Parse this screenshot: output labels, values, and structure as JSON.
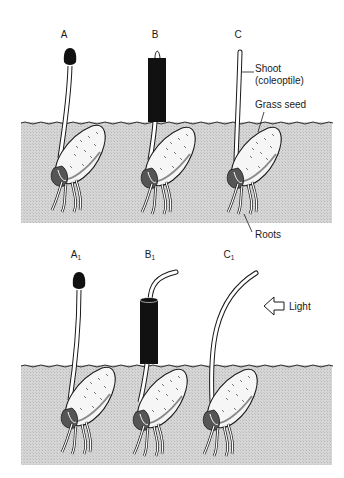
{
  "panels": [
    {
      "id": "top",
      "seedlings": [
        {
          "label": "A",
          "treatment": "tip covered with opaque cap"
        },
        {
          "label": "B",
          "treatment": "base covered with opaque sleeve, tip exposed"
        },
        {
          "label": "C",
          "treatment": "uncovered"
        }
      ],
      "annotations": {
        "shoot": "Shoot",
        "shoot_sub": "(coleoptile)",
        "seed": "Grass seed",
        "roots": "Roots"
      }
    },
    {
      "id": "bottom",
      "seedlings": [
        {
          "label": "A",
          "subscript": "1",
          "response": "straight"
        },
        {
          "label": "B",
          "subscript": "1",
          "response": "bends toward light"
        },
        {
          "label": "C",
          "subscript": "1",
          "response": "bends toward light"
        }
      ],
      "light": {
        "label": "Light",
        "direction": "left"
      }
    }
  ],
  "colors": {
    "soil": "#d4d4d4",
    "ink": "#1a1a1a",
    "cover": "#111111",
    "paper": "#ffffff"
  }
}
